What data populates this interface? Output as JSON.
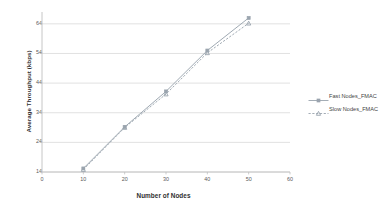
{
  "chart_data": {
    "type": "line",
    "title": "",
    "xlabel": "Number of Nodes",
    "ylabel": "Average Throughput (kbps)",
    "x": [
      10,
      20,
      30,
      40,
      50
    ],
    "xlim": [
      0,
      60
    ],
    "ylim": [
      14,
      68
    ],
    "xticks": [
      0,
      10,
      20,
      30,
      40,
      50,
      60
    ],
    "yticks": [
      14,
      24,
      34,
      44,
      54,
      64
    ],
    "grid": "horizontal",
    "legend_position": "right",
    "series": [
      {
        "name": "Fast Nodes_FMAC",
        "values": [
          15.2,
          29.2,
          41.2,
          55.0,
          66.0
        ],
        "color": "#9aa4ae",
        "marker": "square",
        "linestyle": "solid"
      },
      {
        "name": "Slow Nodes_FMAC",
        "values": [
          14.8,
          29.0,
          40.3,
          54.2,
          64.2
        ],
        "color": "#9aa4ae",
        "marker": "triangle",
        "linestyle": "dashed"
      }
    ],
    "colors": {
      "grid": "#d9d9d9",
      "axis": "#bfbfbf",
      "text": "#5a5a5a",
      "title_text": "#2f2f2f",
      "series": "#9aa4ae",
      "background": "#ffffff"
    }
  }
}
